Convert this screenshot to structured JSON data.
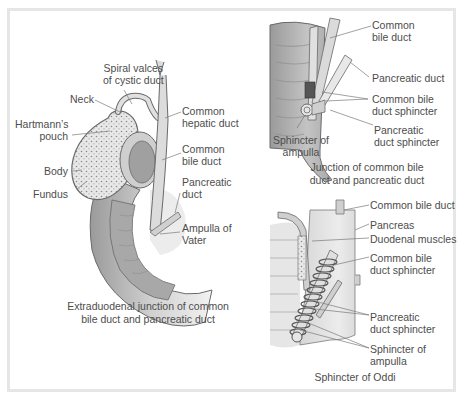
{
  "figure": {
    "panels": [
      {
        "id": "extraduodenal",
        "caption_line1": "Extraduodenal junction of common",
        "caption_line2": "bile duct and pancreatic duct",
        "labels": {
          "spiral_valves_line1": "Spiral valces",
          "spiral_valves_line2": "of cystic duct",
          "neck": "Neck",
          "hartmanns_line1": "Hartmann’s",
          "hartmanns_line2": "pouch",
          "body": "Body",
          "fundus": "Fundus",
          "common_hepatic_line1": "Common",
          "common_hepatic_line2": "hepatic duct",
          "common_bile_line1": "Common",
          "common_bile_line2": "bile duct",
          "pancreatic_line1": "Pancreatic",
          "pancreatic_line2": "duct",
          "ampulla_line1": "Ampulla of",
          "ampulla_line2": "Vater"
        }
      },
      {
        "id": "junction",
        "caption_line1": "Junction of common bile",
        "caption_line2": "duct and pancreatic duct",
        "labels": {
          "common_bile_line1": "Common",
          "common_bile_line2": "bile duct",
          "pancreatic_duct": "Pancreatic duct",
          "cbd_sphincter_line1": "Common bile",
          "cbd_sphincter_line2": "duct sphincter",
          "pd_sphincter_line1": "Pancreatic",
          "pd_sphincter_line2": "duct sphincter",
          "sphincter_ampulla_line1": "Sphincter of",
          "sphincter_ampulla_line2": "ampulla"
        }
      },
      {
        "id": "oddi",
        "caption": "Sphincter of Oddi",
        "labels": {
          "common_bile_duct": "Common bile duct",
          "pancreas": "Pancreas",
          "duodenal_muscles": "Duodenal muscles",
          "cbd_sphincter_line1": "Common bile",
          "cbd_sphincter_line2": "duct sphincter",
          "pd_sphincter_line1": "Pancreatic",
          "pd_sphincter_line2": "duct sphincter",
          "sphincter_ampulla_line1": "Sphincter of",
          "sphincter_ampulla_line2": "ampulla"
        }
      }
    ],
    "colors": {
      "frame": "#e6e6e6",
      "line": "#6a6a6a",
      "fill_light": "#e4e4e4",
      "fill_mid": "#bdbdbd",
      "fill_dark": "#8a8a8a",
      "text": "#4d4d4d"
    }
  }
}
